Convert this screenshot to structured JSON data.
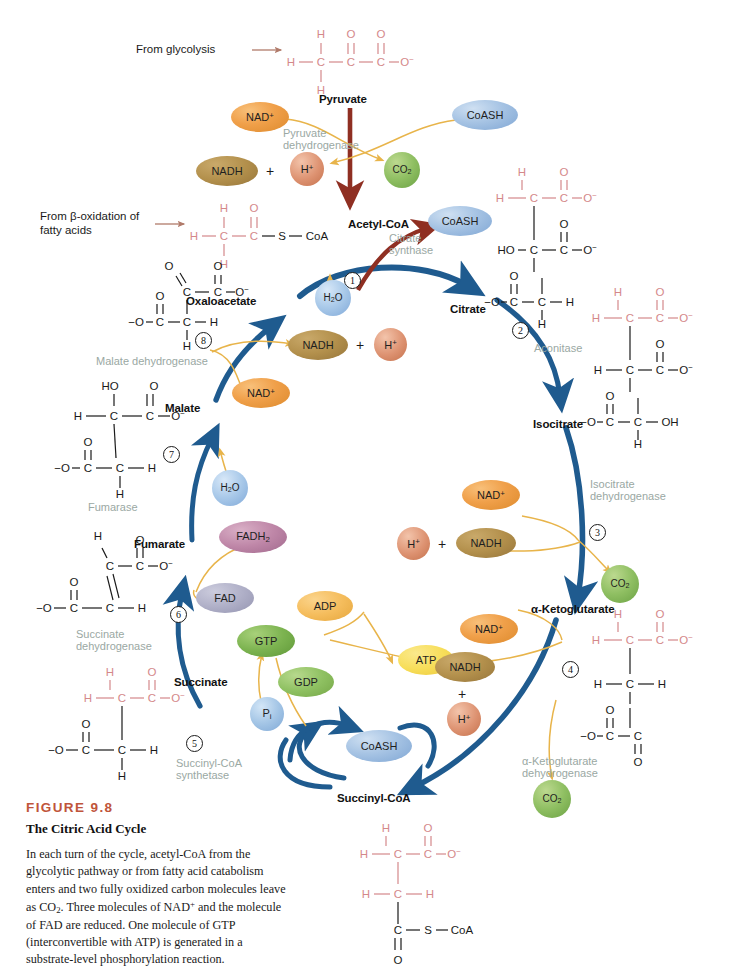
{
  "figure": {
    "number": "FIGURE 9.8",
    "title": "The Citric Acid Cycle",
    "caption": "In each turn of the cycle, acetyl-CoA from the glycolytic pathway or from fatty acid catabolism enters and two fully oxidized carbon molecules leave as CO2. Three molecules of NAD+ and the molecule of FAD are reduced. One molecule of GTP (interconvertible with ATP) is generated in a substrate-level phosphorylation reaction."
  },
  "colors": {
    "cycle_arrow": "#1f5b8f",
    "cofactor_arrow": "#e8b44a",
    "entry_arrow": "#8f2f22",
    "enzyme_text": "#9aa8a3",
    "figure_number": "#c0543a",
    "bond_red": "#d4888a",
    "bond_black": "#1a1a1a"
  },
  "inputs": {
    "from_glycolysis": "From glycolysis",
    "from_beta_oxidation_line1": "From β-oxidation of",
    "from_beta_oxidation_line2": "fatty acids"
  },
  "metabolites": [
    {
      "id": "pyruvate",
      "label": "Pyruvate"
    },
    {
      "id": "acetyl-coa",
      "label": "Acetyl-CoA"
    },
    {
      "id": "oxaloacetate",
      "label": "Oxaloacetate"
    },
    {
      "id": "citrate",
      "label": "Citrate"
    },
    {
      "id": "isocitrate",
      "label": "Isocitrate"
    },
    {
      "id": "alpha-ketoglutarate",
      "label": "α-Ketoglutarate"
    },
    {
      "id": "succinyl-coa",
      "label": "Succinyl-CoA"
    },
    {
      "id": "succinate",
      "label": "Succinate"
    },
    {
      "id": "fumarate",
      "label": "Fumarate"
    },
    {
      "id": "malate",
      "label": "Malate"
    }
  ],
  "enzymes": [
    {
      "step": "",
      "id": "pyruvate-dehydrogenase",
      "line1": "Pyruvate",
      "line2": "dehydrogenase"
    },
    {
      "step": "1",
      "id": "citrate-synthase",
      "line1": "Citrate",
      "line2": "synthase"
    },
    {
      "step": "2",
      "id": "aconitase",
      "line1": "Aconitase",
      "line2": ""
    },
    {
      "step": "3",
      "id": "isocitrate-dehydrogenase",
      "line1": "Isocitrate",
      "line2": "dehydrogenase"
    },
    {
      "step": "4",
      "id": "alpha-ketoglutarate-dehydrogenase",
      "line1": "α-Ketoglutarate",
      "line2": "dehydrogenase"
    },
    {
      "step": "5",
      "id": "succinyl-coa-synthetase",
      "line1": "Succinyl-CoA",
      "line2": "synthetase"
    },
    {
      "step": "6",
      "id": "succinate-dehydrogenase",
      "line1": "Succinate",
      "line2": "dehydrogenase"
    },
    {
      "step": "7",
      "id": "fumarase",
      "line1": "Fumarase",
      "line2": ""
    },
    {
      "step": "8",
      "id": "malate-dehydrogenase",
      "line1": "Malate dehydrogenase",
      "line2": ""
    }
  ],
  "cofactors": {
    "nad_plus": "NAD",
    "nad_plus_charge": "+",
    "nadh": "NADH",
    "h_plus": "H",
    "h_plus_charge": "+",
    "co2": "CO",
    "co2_sub": "2",
    "coash": "CoASH",
    "h2o": "H",
    "h2o_sub": "2",
    "h2o_tail": "O",
    "fad": "FAD",
    "fadh2": "FADH",
    "fadh2_sub": "2",
    "gtp": "GTP",
    "gdp": "GDP",
    "adp": "ADP",
    "atp": "ATP",
    "pi": "P",
    "pi_sub": "i",
    "plus": "+"
  },
  "chart_data": {
    "type": "diagram",
    "title": "The Citric Acid Cycle",
    "cycle_steps": [
      {
        "step": 1,
        "substrate": "Oxaloacetate + Acetyl-CoA",
        "product": "Citrate",
        "enzyme": "Citrate synthase",
        "consumed": [
          "H2O"
        ],
        "released": [
          "CoASH"
        ]
      },
      {
        "step": 2,
        "substrate": "Citrate",
        "product": "Isocitrate",
        "enzyme": "Aconitase",
        "consumed": [],
        "released": []
      },
      {
        "step": 3,
        "substrate": "Isocitrate",
        "product": "α-Ketoglutarate",
        "enzyme": "Isocitrate dehydrogenase",
        "consumed": [
          "NAD+"
        ],
        "released": [
          "NADH",
          "H+",
          "CO2"
        ]
      },
      {
        "step": 4,
        "substrate": "α-Ketoglutarate",
        "product": "Succinyl-CoA",
        "enzyme": "α-Ketoglutarate dehydrogenase",
        "consumed": [
          "NAD+",
          "CoASH"
        ],
        "released": [
          "NADH",
          "H+",
          "CO2"
        ]
      },
      {
        "step": 5,
        "substrate": "Succinyl-CoA",
        "product": "Succinate",
        "enzyme": "Succinyl-CoA synthetase",
        "consumed": [
          "GDP",
          "Pi"
        ],
        "released": [
          "GTP",
          "CoASH"
        ]
      },
      {
        "step": 6,
        "substrate": "Succinate",
        "product": "Fumarate",
        "enzyme": "Succinate dehydrogenase",
        "consumed": [
          "FAD"
        ],
        "released": [
          "FADH2"
        ]
      },
      {
        "step": 7,
        "substrate": "Fumarate",
        "product": "Malate",
        "enzyme": "Fumarase",
        "consumed": [
          "H2O"
        ],
        "released": []
      },
      {
        "step": 8,
        "substrate": "Malate",
        "product": "Oxaloacetate",
        "enzyme": "Malate dehydrogenase",
        "consumed": [
          "NAD+"
        ],
        "released": [
          "NADH",
          "H+"
        ]
      }
    ],
    "entry_reaction": {
      "substrate": "Pyruvate",
      "product": "Acetyl-CoA",
      "enzyme": "Pyruvate dehydrogenase",
      "consumed": [
        "NAD+",
        "CoASH"
      ],
      "released": [
        "NADH",
        "H+",
        "CO2"
      ]
    },
    "side_reaction": {
      "substrate": "GTP + ADP",
      "product": "GDP + ATP"
    },
    "totals": {
      "NADH": 3,
      "FADH2": 1,
      "GTP": 1,
      "CO2": 2
    }
  }
}
